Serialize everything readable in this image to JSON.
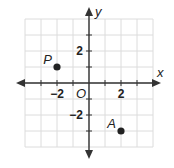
{
  "chart_data": {
    "type": "scatter",
    "title": "",
    "xlabel": "x",
    "ylabel": "y",
    "xlim": [
      -4,
      4
    ],
    "ylim": [
      -4,
      4
    ],
    "grid": true,
    "grid_step": 1,
    "tick_step": 1,
    "x_tick_labels": [
      {
        "value": -2,
        "label": "−2"
      },
      {
        "value": 2,
        "label": "2"
      }
    ],
    "y_tick_labels": [
      {
        "value": 2,
        "label": "2"
      },
      {
        "value": -2,
        "label": "−2"
      }
    ],
    "origin_label": "O",
    "points": [
      {
        "name": "P",
        "x": -2,
        "y": 1
      },
      {
        "name": "A",
        "x": 2,
        "y": -3
      }
    ],
    "colors": {
      "grid": "#dcdcdc",
      "axis": "#333333",
      "point": "#222222"
    }
  }
}
